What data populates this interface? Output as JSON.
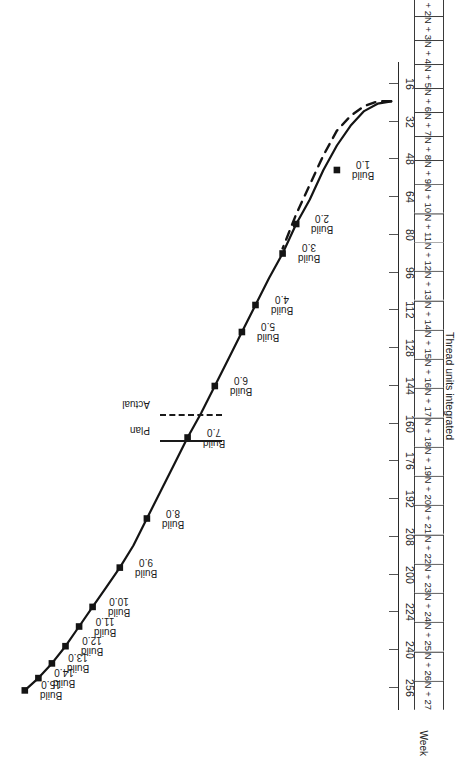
{
  "figure": {
    "value_axis": {
      "title": "Thread units integrated",
      "ticks": [
        "256",
        "240",
        "224",
        "200",
        "208",
        "192",
        "176",
        "160",
        "144",
        "128",
        "112",
        "96",
        "80",
        "64",
        "48",
        "32",
        "16"
      ],
      "min": 0,
      "max": 264
    },
    "week_axis": {
      "caption": "Week",
      "ticks": [
        "N",
        "N + 1",
        "N + 2",
        "N + 3",
        "N + 4",
        "N + 5",
        "N + 6",
        "N + 7",
        "N + 8",
        "N + 9",
        "N + 10",
        "N + 11",
        "N + 12",
        "N + 13",
        "N + 14",
        "N + 15",
        "N + 16",
        "N + 17",
        "N + 18",
        "N + 19",
        "N + 20",
        "N + 21",
        "N + 22",
        "N + 23",
        "N + 24",
        "N + 25",
        "N + 26",
        "N + 27"
      ]
    },
    "legend": {
      "items": [
        {
          "label": "Plan",
          "style": "solid"
        },
        {
          "label": "Actual",
          "style": "dashed"
        }
      ]
    },
    "build_labels": [
      {
        "line1": "Build",
        "line2": "1.0"
      },
      {
        "line1": "Build",
        "line2": "2.0"
      },
      {
        "line1": "Build",
        "line2": "3.0"
      },
      {
        "line1": "Build",
        "line2": "4.0"
      },
      {
        "line1": "Build",
        "line2": "5.0"
      },
      {
        "line1": "Build",
        "line2": "6.0"
      },
      {
        "line1": "Build",
        "line2": "7.0"
      },
      {
        "line1": "Build",
        "line2": "8.0"
      },
      {
        "line1": "Build",
        "line2": "9.0"
      },
      {
        "line1": "Build",
        "line2": "10.0"
      },
      {
        "line1": "Build",
        "line2": "11.0"
      },
      {
        "line1": "Build",
        "line2": "12.0"
      },
      {
        "line1": "Build",
        "line2": "13.0"
      },
      {
        "line1": "Build",
        "line2": "14.0"
      },
      {
        "line1": "Build",
        "line2": "15.0"
      }
    ]
  },
  "chart_data": {
    "type": "line",
    "title": "",
    "xlabel": "Week",
    "ylabel": "Thread units integrated",
    "grid": false,
    "legend_position": "center-left",
    "x": [
      "N",
      "N + 1",
      "N + 2",
      "N + 3",
      "N + 4",
      "N + 5",
      "N + 6",
      "N + 7",
      "N + 8",
      "N + 9",
      "N + 10",
      "N + 11",
      "N + 12",
      "N + 13",
      "N + 14",
      "N + 15",
      "N + 16",
      "N + 17",
      "N + 18",
      "N + 19",
      "N + 20",
      "N + 21",
      "N + 22",
      "N + 23",
      "N + 24",
      "N + 25",
      "N + 26",
      "N + 27"
    ],
    "xlim": [
      "N",
      "N + 27"
    ],
    "ylim": [
      0,
      264
    ],
    "yticks": [
      16,
      32,
      48,
      64,
      80,
      96,
      112,
      128,
      144,
      160,
      176,
      192,
      200,
      208,
      224,
      240,
      256
    ],
    "series": [
      {
        "name": "Plan",
        "style": "solid",
        "marker": "square",
        "values": [
          16,
          17,
          20,
          26,
          34,
          44,
          56,
          66,
          78,
          88,
          99,
          110,
          121,
          132,
          143,
          153,
          164,
          175,
          186,
          197,
          206,
          214,
          222,
          230,
          238,
          245,
          251,
          256
        ],
        "labeled_points": [
          {
            "build": "Build 1.0",
            "week": "N + 4",
            "value": 44
          },
          {
            "build": "Build 2.0",
            "week": "N + 7",
            "value": 66
          },
          {
            "build": "Build 3.0",
            "week": "N + 8",
            "value": 78
          },
          {
            "build": "Build 4.0",
            "week": "N + 10",
            "value": 99
          },
          {
            "build": "Build 5.0",
            "week": "N + 11",
            "value": 110
          },
          {
            "build": "Build 6.0",
            "week": "N + 13",
            "value": 132
          },
          {
            "build": "Build 7.0",
            "week": "N + 15",
            "value": 153
          },
          {
            "build": "Build 8.0",
            "week": "N + 18",
            "value": 186
          },
          {
            "build": "Build 9.0",
            "week": "N + 20",
            "value": 206
          },
          {
            "build": "Build 10.0",
            "week": "N + 22",
            "value": 222
          },
          {
            "build": "Build 11.0",
            "week": "N + 23",
            "value": 230
          },
          {
            "build": "Build 12.0",
            "week": "N + 24",
            "value": 238
          },
          {
            "build": "Build 13.0",
            "week": "N + 25",
            "value": 245
          },
          {
            "build": "Build 14.0",
            "week": "N + 26",
            "value": 251
          },
          {
            "build": "Build 15.0",
            "week": "N + 27",
            "value": 256
          }
        ]
      },
      {
        "name": "Actual",
        "style": "dashed",
        "marker": "none",
        "values": [
          16,
          16,
          18,
          22,
          28,
          38,
          50,
          62,
          76,
          null,
          null,
          null,
          null,
          null,
          null,
          null,
          null,
          null,
          null,
          null,
          null,
          null,
          null,
          null,
          null,
          null,
          null,
          null
        ]
      }
    ]
  }
}
